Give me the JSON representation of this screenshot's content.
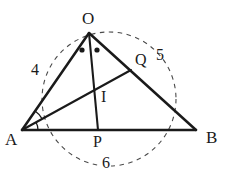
{
  "figure": {
    "type": "geometry-diagram",
    "canvas": {
      "width": 226,
      "height": 186
    },
    "stroke_color": "#1a1a1a",
    "dashed_color": "#4a4a4a",
    "label_color": "#1a1a1a"
  },
  "vertices": [
    {
      "id": "O",
      "label": "O",
      "x": 89,
      "y": 33,
      "label_x": 82,
      "label_y": 10
    },
    {
      "id": "A",
      "label": "A",
      "x": 22,
      "y": 130,
      "label_x": 5,
      "label_y": 131
    },
    {
      "id": "B",
      "label": "B",
      "x": 196,
      "y": 130,
      "label_x": 206,
      "label_y": 129
    }
  ],
  "points": [
    {
      "id": "Q",
      "label": "Q",
      "x": 131,
      "y": 70,
      "label_x": 135,
      "label_y": 52
    },
    {
      "id": "I",
      "label": "I",
      "x": 97,
      "y": 96,
      "label_x": 101,
      "label_y": 89
    },
    {
      "id": "P",
      "label": "P",
      "x": 98,
      "y": 130,
      "label_x": 93,
      "label_y": 134
    }
  ],
  "segments": [
    {
      "name": "side-OA",
      "from": "O",
      "to": "A"
    },
    {
      "name": "side-OB",
      "from": "O",
      "to": "B"
    },
    {
      "name": "side-AB",
      "from": "A",
      "to": "B"
    },
    {
      "name": "cevian-OP",
      "from": "O",
      "to": "P"
    },
    {
      "name": "bisector-AQ",
      "from": "A",
      "to": "Q"
    }
  ],
  "length_labels": [
    {
      "id": "len-OA",
      "value": "4",
      "x": 31,
      "y": 62,
      "for": "side-OA"
    },
    {
      "id": "len-OB",
      "value": "5",
      "x": 156,
      "y": 47,
      "for": "side-OB"
    },
    {
      "id": "len-AB",
      "value": "6",
      "x": 101,
      "y": 155,
      "for": "side-AB"
    }
  ],
  "marks": {
    "angle_dots_at_O": [
      {
        "x": 82,
        "y": 50
      },
      {
        "x": 97,
        "y": 50
      }
    ],
    "angle_dots_label": "equal-angle-dots",
    "angle_arcs_at_A": [
      {
        "radius": 16
      },
      {
        "radius": 23
      }
    ],
    "angle_arcs_label": "equal-angle-arcs"
  },
  "circle": {
    "name": "circumcircle",
    "center_x": 109,
    "center_y": 99,
    "radius": 67,
    "style": "dashed"
  }
}
